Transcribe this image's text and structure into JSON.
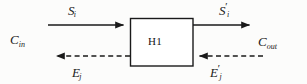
{
  "diagram": {
    "type": "block-flow-diagram",
    "width": 307,
    "height": 84,
    "background_color": "#fcfcfb",
    "stroke_color": "#1a1a1a",
    "block": {
      "label": "H1",
      "name": "heat-exchanger-block",
      "x": 130,
      "y": 18,
      "width": 63,
      "height": 48,
      "fill": "#ffffff"
    },
    "labels": {
      "stream_in": {
        "base": "S",
        "sub": "i",
        "prime": ""
      },
      "stream_out": {
        "base": "S",
        "sub": "i",
        "prime": "′"
      },
      "cold_in": {
        "base": "C",
        "sub": "in",
        "prime": ""
      },
      "cold_out": {
        "base": "C",
        "sub": "out",
        "prime": ""
      },
      "energy_out": {
        "base": "E",
        "sub": "j",
        "prime": ""
      },
      "energy_in": {
        "base": "E",
        "sub": "j",
        "prime": "′"
      }
    },
    "arrows": [
      {
        "name": "solid-arrow-top-left-inlet",
        "style": "solid",
        "direction": "right",
        "x1": 48,
        "y1": 25,
        "x2": 130,
        "y2": 25
      },
      {
        "name": "solid-arrow-top-right-outlet",
        "style": "solid",
        "direction": "right",
        "x1": 193,
        "y1": 25,
        "x2": 256,
        "y2": 25
      },
      {
        "name": "dashed-arrow-bottom-left-outlet",
        "style": "dashed",
        "direction": "left",
        "x1": 130,
        "y1": 56,
        "x2": 50,
        "y2": 56
      },
      {
        "name": "dashed-arrow-bottom-right-inlet",
        "style": "dashed",
        "direction": "left",
        "x1": 263,
        "y1": 56,
        "x2": 193,
        "y2": 56
      }
    ]
  }
}
